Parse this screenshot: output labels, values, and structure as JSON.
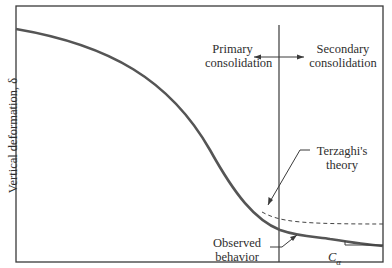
{
  "figure": {
    "y_axis_label": "Vertical deformation, δ",
    "regions": {
      "primary": {
        "line1": "Primary",
        "line2": "consolidation"
      },
      "secondary": {
        "line1": "Secondary",
        "line2": "consolidation"
      }
    },
    "annotations": {
      "terzaghi": {
        "line1": "Terzaghi's",
        "line2": "theory"
      },
      "observed": {
        "line1": "Observed",
        "line2": "behavior"
      },
      "slope_label_base": "C",
      "slope_label_sub": "α"
    },
    "colors": {
      "frame": "#3a3a3a",
      "curve": "#555555",
      "dashed": "#444444"
    }
  }
}
